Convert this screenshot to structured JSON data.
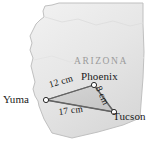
{
  "figure": {
    "type": "map-diagram",
    "state_label": "ARIZONA",
    "cities": [
      {
        "id": "yuma",
        "name": "Yuma",
        "x": 46,
        "y": 100
      },
      {
        "id": "phoenix",
        "name": "Phoenix",
        "x": 94,
        "y": 85
      },
      {
        "id": "tucson",
        "name": "Tucson",
        "x": 114,
        "y": 112
      }
    ],
    "distances": [
      {
        "id": "yuma-phoenix",
        "from": "Yuma",
        "to": "Phoenix",
        "label": "12 cm",
        "value": 12,
        "unit": "cm"
      },
      {
        "id": "phoenix-tucson",
        "from": "Phoenix",
        "to": "Tucson",
        "label": "8 cm",
        "value": 8,
        "unit": "cm"
      },
      {
        "id": "yuma-tucson",
        "from": "Yuma",
        "to": "Tucson",
        "label": "17 cm",
        "value": 17,
        "unit": "cm"
      }
    ],
    "colors": {
      "state_fill": "#e8e8e8",
      "state_stroke": "#c4c4c4",
      "triangle_fill": "#cfcfcf",
      "triangle_stroke": "#6e6e6e",
      "marker": "#ffffff",
      "marker_stroke": "#2a2a2a",
      "text": "#1a1a1a",
      "state_text": "#9b9b9b",
      "background": "#ffffff"
    }
  }
}
